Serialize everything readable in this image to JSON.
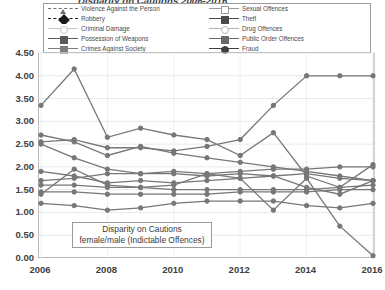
{
  "chart": {
    "title": "Disparity on Cautions 2006-2016",
    "annotation_line1": "Disparity on Cautions",
    "annotation_line2": "female/male (Indictable Offences)"
  },
  "legend": {
    "entries": [
      {
        "label": "Violence Against the Person",
        "marker": "triangle",
        "dash": "dashed",
        "color": "#6f6f6f"
      },
      {
        "label": "Sexual Offences",
        "marker": "square-open",
        "dash": "solid",
        "color": "#9b9b9b"
      },
      {
        "label": "Robbery",
        "marker": "diamond",
        "dash": "dashed",
        "color": "#1a1a1a"
      },
      {
        "label": "Theft",
        "marker": "square",
        "dash": "solid",
        "color": "#4a4a4a"
      },
      {
        "label": "Criminal Damage",
        "marker": "circle-open",
        "dash": "solid",
        "color": "#c6c6c6"
      },
      {
        "label": "Drug Offences",
        "marker": "circle-open",
        "dash": "solid",
        "color": "#b4b4b4"
      },
      {
        "label": "Possession of Weapons",
        "marker": "square",
        "dash": "solid",
        "color": "#595959"
      },
      {
        "label": "Public Order Offences",
        "marker": "square",
        "dash": "solid",
        "color": "#6a6a6a"
      },
      {
        "label": "Crimes Against Society",
        "marker": "square",
        "dash": "solid",
        "color": "#7d7d7d"
      },
      {
        "label": "Fraud",
        "marker": "circle",
        "dash": "solid",
        "color": "#3f3f3f"
      }
    ]
  },
  "axes": {
    "y_ticks": [
      "4.50",
      "4.00",
      "3.50",
      "3.00",
      "2.50",
      "2.00",
      "1.50",
      "1.00",
      "0.50",
      "0.00"
    ],
    "x_ticks": [
      "2006",
      "2008",
      "2010",
      "2012",
      "2014",
      "2016"
    ]
  },
  "chart_data": {
    "type": "line",
    "title": "Disparity on Cautions 2006-2016",
    "xlabel": "",
    "ylabel": "",
    "ylim": [
      0.0,
      4.5
    ],
    "grid": true,
    "legend_position": "top",
    "x": [
      2006,
      2007,
      2008,
      2009,
      2010,
      2011,
      2012,
      2013,
      2014,
      2015,
      2016
    ],
    "series": [
      {
        "name": "Violence Against the Person",
        "values": [
          2.55,
          2.6,
          2.42,
          2.42,
          2.35,
          2.45,
          2.6,
          3.35,
          4.0,
          4.0,
          4.0
        ]
      },
      {
        "name": "Sexual Offences",
        "values": [
          3.35,
          4.15,
          2.65,
          2.85,
          2.7,
          2.6,
          2.25,
          2.75,
          1.8,
          1.55,
          2.05
        ]
      },
      {
        "name": "Robbery",
        "values": [
          1.4,
          1.95,
          1.6,
          1.55,
          1.6,
          1.85,
          1.75,
          1.05,
          1.75,
          0.7,
          0.05
        ]
      },
      {
        "name": "Theft",
        "values": [
          2.7,
          2.55,
          2.25,
          2.45,
          2.3,
          2.2,
          2.1,
          2.0,
          1.9,
          1.8,
          1.7
        ]
      },
      {
        "name": "Criminal Damage",
        "values": [
          1.6,
          1.6,
          1.55,
          1.55,
          1.5,
          1.5,
          1.5,
          1.5,
          1.5,
          1.55,
          1.6
        ]
      },
      {
        "name": "Drug Offences",
        "values": [
          1.45,
          1.45,
          1.4,
          1.4,
          1.4,
          1.4,
          1.45,
          1.45,
          1.45,
          1.5,
          1.5
        ]
      },
      {
        "name": "Possession of Weapons",
        "values": [
          1.7,
          1.75,
          1.85,
          1.85,
          1.9,
          1.85,
          1.9,
          1.95,
          1.95,
          2.0,
          2.0
        ]
      },
      {
        "name": "Public Order Offences",
        "values": [
          2.5,
          2.2,
          1.95,
          1.85,
          1.85,
          1.8,
          1.85,
          1.8,
          1.55,
          1.4,
          1.7
        ]
      },
      {
        "name": "Crimes Against Society",
        "values": [
          1.9,
          1.8,
          1.65,
          1.7,
          1.65,
          1.7,
          1.75,
          1.8,
          1.85,
          1.75,
          1.7
        ]
      },
      {
        "name": "Fraud",
        "values": [
          1.2,
          1.15,
          1.05,
          1.1,
          1.2,
          1.25,
          1.25,
          1.25,
          1.15,
          1.1,
          1.2
        ]
      }
    ]
  }
}
